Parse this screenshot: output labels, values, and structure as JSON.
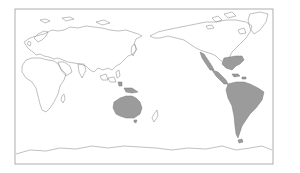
{
  "map": {
    "projection": "equirectangular, Pacific-centered",
    "frame": {
      "x": 15,
      "y": 9,
      "width": 258,
      "height": 155
    },
    "colors": {
      "background": "#ffffff",
      "frame": "#9a9a9a",
      "outline": "#8c8c8c",
      "highlight": "#9b9b9b"
    },
    "outline_regions": [
      {
        "name": "europe-asia",
        "d": "M24,42 L30,38 L36,36 L44,34 L52,30 L58,31 L64,30 L70,27 L78,28 L86,26 L94,27 L102,28 L110,30 L118,31 L126,30 L132,32 L138,34 L142,36 L136,39 L134,44 L137,49 L133,54 L128,56 L124,60 L120,64 L116,66 L112,70 L108,68 L103,70 L98,68 L94,72 L90,70 L86,66 L80,64 L74,63 L68,62 L63,60 L58,58 L54,59 L49,57 L44,56 L40,54 L36,55 L33,52 L30,50 L27,47 Z"
      },
      {
        "name": "scandinavia",
        "d": "M34,38 L38,34 L44,31 L48,32 L46,36 L42,40 L38,42 Z"
      },
      {
        "name": "british-isles",
        "d": "M27,44 L29,41 L31,43 L30,46 Z"
      },
      {
        "name": "arctic-islands",
        "d": "M40,20 L46,19 L50,21 L45,23 Z M62,18 L70,17 L74,19 L66,21 Z M96,22 L104,20 L110,23 L102,25 Z"
      },
      {
        "name": "africa",
        "d": "M26,60 L32,58 L40,58 L48,60 L54,61 L58,64 L62,70 L66,74 L64,80 L60,86 L58,94 L54,102 L50,108 L46,112 L42,110 L40,104 L38,96 L36,88 L32,82 L26,78 L22,72 L22,66 Z"
      },
      {
        "name": "madagascar",
        "d": "M62,96 L64,94 L65,99 L63,103 L61,100 Z"
      },
      {
        "name": "arabia",
        "d": "M58,62 L64,62 L70,66 L72,72 L66,76 L61,70 Z"
      },
      {
        "name": "india",
        "d": "M78,64 L84,64 L86,70 L82,78 L79,72 Z"
      },
      {
        "name": "japan",
        "d": "M132,46 L135,44 L136,50 L133,56 L131,52 Z"
      },
      {
        "name": "southeast-asia-islands",
        "d": "M100,76 L106,74 L108,80 L102,80 Z M108,78 L114,77 L116,82 L110,82 Z M116,72 L119,70 L120,76 L117,78 Z"
      },
      {
        "name": "new-zealand",
        "d": "M154,114 L157,110 L158,116 L154,122 L152,118 Z"
      },
      {
        "name": "north-america",
        "d": "M150,36 L158,32 L166,30 L176,28 L186,26 L196,24 L206,22 L216,22 L226,20 L236,20 L246,22 L252,26 L250,32 L246,38 L240,44 L236,48 L232,52 L230,56 L228,60 L224,62 L220,60 L216,56 L212,54 L206,52 L200,50 L196,48 L190,44 L184,40 L176,38 L168,36 L160,38 L154,38 Z"
      },
      {
        "name": "greenland",
        "d": "M250,14 L260,12 L268,14 L266,22 L260,30 L254,34 L250,28 L248,20 Z"
      },
      {
        "name": "canadian-arctic-islands",
        "d": "M212,18 L218,16 L222,20 L216,22 Z M224,14 L232,12 L236,16 L228,18 Z M206,26 L212,25 L214,28 L208,29 Z M238,30 L244,28 L246,33 L240,34 Z"
      },
      {
        "name": "antarctica",
        "d": "M16,154 L30,150 L46,151 L60,148 L76,149 L92,146 L108,148 L124,146 L140,147 L156,148 L172,150 L188,148 L206,149 L222,146 L236,150 L250,148 L262,146 L272,150"
      }
    ],
    "highlighted_regions": [
      {
        "name": "southeastern-us",
        "d": "M224,58 L236,56 L242,56 L244,60 L240,64 L236,66 L232,70 L226,68 L222,64 Z"
      },
      {
        "name": "western-mexico",
        "d": "M200,52 L204,54 L208,60 L212,66 L214,70 L210,70 L206,64 L202,58 Z"
      },
      {
        "name": "central-america",
        "d": "M212,70 L218,72 L222,76 L226,80 L228,84 L224,84 L220,80 L216,76 Z"
      },
      {
        "name": "caribbean",
        "d": "M232,74 L238,74 L240,76 L234,77 Z M242,77 L246,77 L246,79 L242,79 Z"
      },
      {
        "name": "south-america",
        "d": "M228,84 L236,82 L244,82 L250,84 L258,88 L264,92 L262,100 L256,108 L250,114 L246,120 L242,126 L240,132 L238,138 L236,134 L235,126 L234,116 L232,106 L228,98 L226,90 Z"
      },
      {
        "name": "tierra-del-fuego",
        "d": "M238,140 L242,139 L243,142 L239,143 Z"
      },
      {
        "name": "australia",
        "d": "M114,102 L120,98 L126,96 L132,96 L136,98 L140,102 L142,108 L140,114 L134,118 L126,118 L120,116 L116,114 L113,108 Z"
      },
      {
        "name": "tasmania",
        "d": "M134,120 L137,120 L136,123 L134,122 Z"
      },
      {
        "name": "new-guinea",
        "d": "M124,88 L132,88 L138,92 L132,93 L126,92 Z"
      },
      {
        "name": "indonesia-east",
        "d": "M118,82 L122,82 L122,86 L119,86 Z"
      }
    ]
  }
}
